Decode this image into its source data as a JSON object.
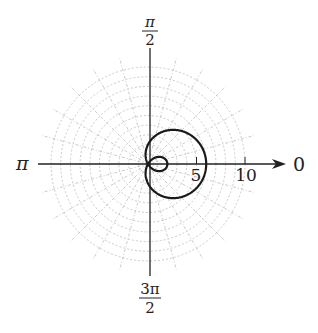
{
  "chart_data": {
    "type": "line",
    "coordinate_system": "polar",
    "title": "",
    "equation": "r = 2 + 4cos(theta)",
    "curve": {
      "name": "limacon with inner loop",
      "a": 2,
      "b": 4,
      "max_r": 6,
      "inner_loop_r": 2
    },
    "angle_labels": {
      "right": "0",
      "top_num": "π",
      "top_den": "2",
      "left": "π",
      "bottom_num": "3π",
      "bottom_den": "2"
    },
    "radial_ticks": [
      {
        "value": 5,
        "label": "5"
      },
      {
        "value": 10,
        "label": "10"
      }
    ],
    "grid": {
      "circles_max": 10,
      "circle_step": 1,
      "radial_step_deg": 15,
      "color": "#c4c4c4"
    },
    "colors": {
      "curve": "#1a1a1a",
      "axis": "#222222"
    },
    "layout": {
      "origin_x": 148,
      "origin_y": 164,
      "px_per_unit": 9.7,
      "axis_left": 38,
      "axis_right": 286,
      "axis_top": 48,
      "axis_bottom": 276
    }
  }
}
